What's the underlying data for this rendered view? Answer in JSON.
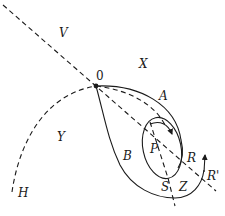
{
  "diagram": {
    "labels": {
      "V": "V",
      "X": "X",
      "O": "0",
      "A": "A",
      "Y": "Y",
      "B": "B",
      "P": "P",
      "R": "R",
      "R_prime": "R'",
      "S": "S",
      "Z": "Z",
      "H": "H"
    },
    "colors": {
      "ink": "#1a1a1a",
      "background": "#ffffff"
    },
    "elements": [
      "dashed-diagonal-line",
      "dashed-arc-H",
      "outer-solid-loop-A-B",
      "inner-ellipse-around-P",
      "dashed-curve-arrow",
      "dashed-vertical-line-S",
      "arrow-R-prime",
      "saddle-point-O"
    ]
  }
}
